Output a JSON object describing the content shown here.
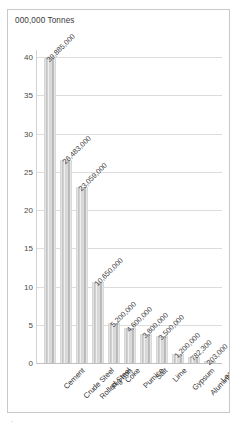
{
  "frame": {
    "unit_title": "000,000 Tonnes",
    "stray_mark": "·"
  },
  "chart_data": {
    "type": "bar",
    "title": "000,000 Tonnes",
    "xlabel": "",
    "ylabel": "000,000 Tonnes",
    "ylim": [
      0,
      40
    ],
    "ytick_labels": [
      "0",
      "5",
      "10",
      "15",
      "20",
      "25",
      "30",
      "35",
      "40"
    ],
    "ytick_values": [
      0,
      5,
      10,
      15,
      20,
      25,
      30,
      35,
      40
    ],
    "grid": true,
    "legend": "none",
    "unit_scale": "millions of tonnes",
    "categories": [
      "Cement",
      "Crude Steel",
      "Rolled Steel",
      "Pig Iron",
      "Coke",
      "Pumice",
      "Salt",
      "Lime",
      "Gypsum",
      "Aluminium",
      "Lead"
    ],
    "values": [
      39.885,
      26.483,
      23.059,
      10.65,
      5.2,
      4.6,
      3.8,
      3.5,
      1.2,
      0.7823,
      0.203
    ],
    "data_labels": [
      "39,885,000",
      "26,483,000",
      "23,059,000",
      "10,650,000",
      "5,200,000",
      "4,600,000",
      "3,800,000",
      "3,500,000",
      "1,200,000",
      "782,300",
      "203,000"
    ]
  }
}
